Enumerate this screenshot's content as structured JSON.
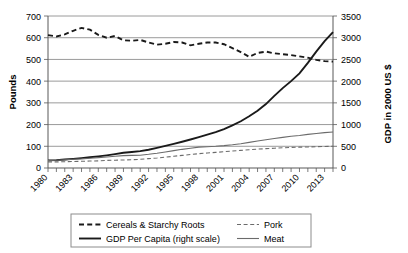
{
  "chart_data": {
    "type": "line",
    "title": "",
    "xlabel": "",
    "ylabel": "Pounds",
    "y2label": "GDP in 2000 US $",
    "grid": true,
    "legend_position": "bottom",
    "xlim": [
      1980,
      2014
    ],
    "ylim": [
      0,
      700
    ],
    "y2lim": [
      0,
      3500
    ],
    "yticks": [
      0,
      100,
      200,
      300,
      400,
      500,
      600,
      700
    ],
    "y2ticks": [
      0,
      500,
      1000,
      1500,
      2000,
      2500,
      3000,
      3500
    ],
    "xtick_labels": [
      "1980",
      "1983",
      "1986",
      "1989",
      "1992",
      "1995",
      "1998",
      "2001",
      "2004",
      "2007",
      "2010",
      "2013"
    ],
    "x": [
      1980,
      1981,
      1982,
      1983,
      1984,
      1985,
      1986,
      1987,
      1988,
      1989,
      1990,
      1991,
      1992,
      1993,
      1994,
      1995,
      1996,
      1997,
      1998,
      1999,
      2000,
      2001,
      2002,
      2003,
      2004,
      2005,
      2006,
      2007,
      2008,
      2009,
      2010,
      2011,
      2012,
      2013,
      2014
    ],
    "series": [
      {
        "name": "Cereals & Starchy Roots",
        "axis": "left",
        "style": "bold-dashed",
        "units": "Pounds",
        "values": [
          612,
          606,
          615,
          632,
          645,
          637,
          613,
          600,
          608,
          588,
          586,
          590,
          578,
          568,
          572,
          580,
          578,
          565,
          572,
          578,
          578,
          570,
          552,
          534,
          512,
          530,
          536,
          528,
          524,
          520,
          514,
          508,
          498,
          492,
          490
        ]
      },
      {
        "name": "GDP Per Capita (right scale)",
        "axis": "right",
        "style": "bold-solid",
        "units": "GDP in 2000 US $",
        "values": [
          175,
          182,
          196,
          210,
          228,
          248,
          268,
          292,
          320,
          352,
          368,
          388,
          420,
          462,
          508,
          556,
          604,
          656,
          712,
          768,
          828,
          896,
          980,
          1076,
          1190,
          1320,
          1472,
          1660,
          1840,
          2000,
          2180,
          2420,
          2680,
          2920,
          3130
        ]
      },
      {
        "name": "Meat",
        "axis": "left",
        "style": "thin-solid",
        "units": "Pounds",
        "values": [
          35,
          36,
          38,
          40,
          42,
          45,
          48,
          51,
          54,
          57,
          58,
          59,
          63,
          68,
          74,
          80,
          86,
          91,
          96,
          98,
          100,
          103,
          107,
          112,
          118,
          124,
          130,
          136,
          141,
          146,
          150,
          155,
          159,
          163,
          166
        ]
      },
      {
        "name": "Pork",
        "axis": "left",
        "style": "thin-dashed",
        "units": "Pounds",
        "values": [
          28,
          28,
          29,
          30,
          31,
          32,
          33,
          35,
          36,
          37,
          38,
          40,
          43,
          46,
          50,
          54,
          58,
          62,
          66,
          69,
          72,
          75,
          78,
          81,
          84,
          87,
          89,
          91,
          93,
          95,
          96,
          97,
          98,
          99,
          100
        ]
      }
    ],
    "legend": [
      {
        "label": "Cereals & Starchy Roots",
        "style": "bold-dashed"
      },
      {
        "label": "Pork",
        "style": "thin-dashed"
      },
      {
        "label": "GDP Per Capita (right scale)",
        "style": "bold-solid"
      },
      {
        "label": "Meat",
        "style": "thin-solid"
      }
    ]
  }
}
